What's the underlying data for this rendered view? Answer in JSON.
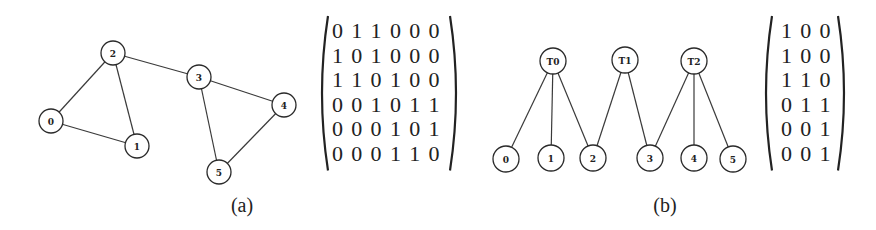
{
  "figure_a": {
    "caption": "(a)",
    "nodes": [
      {
        "id": "0",
        "x": 51,
        "y": 121
      },
      {
        "id": "1",
        "x": 137,
        "y": 146
      },
      {
        "id": "2",
        "x": 113,
        "y": 53
      },
      {
        "id": "3",
        "x": 199,
        "y": 77
      },
      {
        "id": "4",
        "x": 284,
        "y": 105
      },
      {
        "id": "5",
        "x": 219,
        "y": 172
      }
    ],
    "edges": [
      [
        "0",
        "1"
      ],
      [
        "0",
        "2"
      ],
      [
        "1",
        "2"
      ],
      [
        "2",
        "3"
      ],
      [
        "3",
        "4"
      ],
      [
        "3",
        "5"
      ],
      [
        "4",
        "5"
      ]
    ],
    "matrix": [
      [
        0,
        1,
        1,
        0,
        0,
        0
      ],
      [
        1,
        0,
        1,
        0,
        0,
        0
      ],
      [
        1,
        1,
        0,
        1,
        0,
        0
      ],
      [
        0,
        0,
        1,
        0,
        1,
        1
      ],
      [
        0,
        0,
        0,
        1,
        0,
        1
      ],
      [
        0,
        0,
        0,
        1,
        1,
        0
      ]
    ]
  },
  "figure_b": {
    "caption": "(b)",
    "nodes": [
      {
        "id": "T0",
        "x": 553,
        "y": 61
      },
      {
        "id": "T1",
        "x": 625,
        "y": 60
      },
      {
        "id": "T2",
        "x": 694,
        "y": 61
      },
      {
        "id": "0",
        "x": 506,
        "y": 159
      },
      {
        "id": "1",
        "x": 551,
        "y": 158
      },
      {
        "id": "2",
        "x": 593,
        "y": 158
      },
      {
        "id": "3",
        "x": 650,
        "y": 158
      },
      {
        "id": "4",
        "x": 694,
        "y": 158
      },
      {
        "id": "5",
        "x": 733,
        "y": 159
      }
    ],
    "edges": [
      [
        "T0",
        "0"
      ],
      [
        "T0",
        "1"
      ],
      [
        "T0",
        "2"
      ],
      [
        "T1",
        "2"
      ],
      [
        "T1",
        "3"
      ],
      [
        "T2",
        "3"
      ],
      [
        "T2",
        "4"
      ],
      [
        "T2",
        "5"
      ]
    ],
    "matrix": [
      [
        1,
        0,
        0
      ],
      [
        1,
        0,
        0
      ],
      [
        1,
        1,
        0
      ],
      [
        0,
        1,
        1
      ],
      [
        0,
        0,
        1
      ],
      [
        0,
        0,
        1
      ]
    ]
  }
}
